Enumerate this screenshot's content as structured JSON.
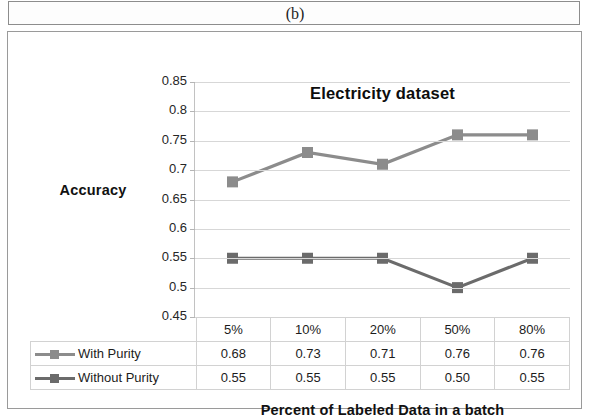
{
  "caption": "(b)",
  "chart_data": {
    "type": "line",
    "title": "Electricity dataset",
    "xlabel": "Percent of Labeled Data in a batch",
    "ylabel": "Accuracy",
    "categories": [
      "5%",
      "10%",
      "20%",
      "50%",
      "80%"
    ],
    "ylim": [
      0.45,
      0.85
    ],
    "ytick_step": 0.05,
    "yticks": [
      "0.85",
      "0.8",
      "0.75",
      "0.7",
      "0.65",
      "0.6",
      "0.55",
      "0.5",
      "0.45"
    ],
    "ytick_values": [
      0.85,
      0.8,
      0.75,
      0.7,
      0.65,
      0.6,
      0.55,
      0.5,
      0.45
    ],
    "grid": true,
    "legend_position": "bottom-table",
    "marker": "square",
    "series": [
      {
        "name": "With Purity",
        "values": [
          0.68,
          0.73,
          0.71,
          0.76,
          0.76
        ],
        "labels": [
          "0.68",
          "0.73",
          "0.71",
          "0.76",
          "0.76"
        ],
        "color": "#8c8c8c"
      },
      {
        "name": "Without Purity",
        "values": [
          0.55,
          0.55,
          0.55,
          0.5,
          0.55
        ],
        "labels": [
          "0.55",
          "0.55",
          "0.55",
          "0.50",
          "0.55"
        ],
        "color": "#6b6b6b"
      }
    ]
  },
  "colors": {
    "series_with_purity": "#8c8c8c",
    "series_without_purity": "#6b6b6b",
    "gridline": "#d7d7d7",
    "frame_border": "#9a9a9a",
    "table_border": "#d2d2d2",
    "text": "#1a1a1a"
  }
}
